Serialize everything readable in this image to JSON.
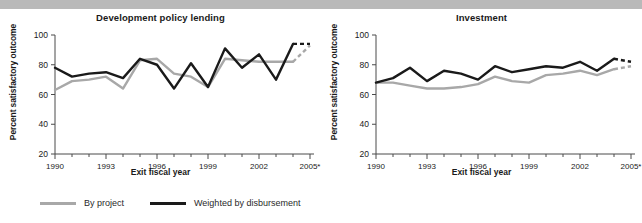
{
  "figure": {
    "ylabel": "Percent satisfactory outcome",
    "xlabel": "Exit fiscal year",
    "ytick_labels": [
      "20",
      "40",
      "60",
      "80",
      "100"
    ],
    "xtick_labels": [
      "1990",
      "1993",
      "1996",
      "1999",
      "2002",
      "2005*"
    ]
  },
  "legend": {
    "items": [
      {
        "label": "By project",
        "color": "#a8a8a8",
        "key": "by_project"
      },
      {
        "label": "Weighted by disbursement",
        "color": "#1a1a1a",
        "key": "weighted_by_disbursement"
      }
    ]
  },
  "chart_data": [
    {
      "type": "line",
      "title": "Development policy lending",
      "xlabel": "Exit fiscal year",
      "ylabel": "Percent satisfactory outcome",
      "xlim": [
        1990,
        2005
      ],
      "ylim": [
        20,
        100
      ],
      "yticks": [
        20,
        40,
        60,
        80,
        100
      ],
      "xticks": [
        1990,
        1993,
        1996,
        1999,
        2002,
        2005
      ],
      "grid": false,
      "legend_position": "below-figure",
      "x": [
        1990,
        1991,
        1992,
        1993,
        1994,
        1995,
        1996,
        1997,
        1998,
        1999,
        2000,
        2001,
        2002,
        2003,
        2004,
        2005
      ],
      "series": [
        {
          "name": "By project",
          "color": "#a8a8a8",
          "values": [
            63,
            69,
            70,
            72,
            64,
            83,
            84,
            74,
            72,
            65,
            84,
            83,
            82,
            82,
            82,
            93
          ],
          "dashed_from_index": 14
        },
        {
          "name": "Weighted by disbursement",
          "color": "#1a1a1a",
          "values": [
            78,
            72,
            74,
            75,
            71,
            84,
            80,
            64,
            81,
            65,
            91,
            78,
            87,
            70,
            94,
            94
          ],
          "dashed_from_index": 14
        }
      ]
    },
    {
      "type": "line",
      "title": "Investment",
      "xlabel": "Exit fiscal year",
      "ylabel": "Percent satisfactory outcome",
      "xlim": [
        1990,
        2005
      ],
      "ylim": [
        20,
        100
      ],
      "yticks": [
        20,
        40,
        60,
        80,
        100
      ],
      "xticks": [
        1990,
        1993,
        1996,
        1999,
        2002,
        2005
      ],
      "grid": false,
      "legend_position": "below-figure",
      "x": [
        1990,
        1991,
        1992,
        1993,
        1994,
        1995,
        1996,
        1997,
        1998,
        1999,
        2000,
        2001,
        2002,
        2003,
        2004,
        2005
      ],
      "series": [
        {
          "name": "By project",
          "color": "#a8a8a8",
          "values": [
            68,
            68,
            66,
            64,
            64,
            65,
            67,
            72,
            69,
            68,
            73,
            74,
            76,
            73,
            77,
            79
          ],
          "dashed_from_index": 14
        },
        {
          "name": "Weighted by disbursement",
          "color": "#1a1a1a",
          "values": [
            68,
            71,
            78,
            69,
            76,
            74,
            70,
            79,
            75,
            77,
            79,
            78,
            82,
            76,
            84,
            82
          ],
          "dashed_from_index": 14
        }
      ]
    }
  ]
}
